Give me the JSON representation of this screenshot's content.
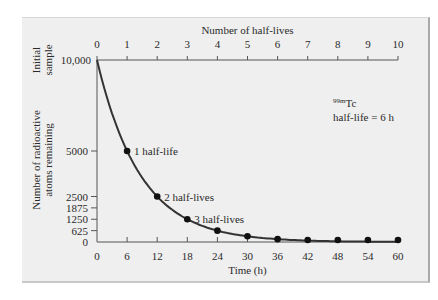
{
  "chart_data": {
    "type": "line",
    "title": "",
    "xlabel": "Time (h)",
    "x2label": "Number of half-lives",
    "ylabel": "Number of radioactive atoms remaining",
    "ylabel_top": "Initial sample",
    "x_ticks": [
      0,
      6,
      12,
      18,
      24,
      30,
      36,
      42,
      48,
      54,
      60
    ],
    "x2_ticks": [
      0,
      1,
      2,
      3,
      4,
      5,
      6,
      7,
      8,
      9,
      10
    ],
    "y_ticks": [
      "0",
      "625",
      "1250",
      "1875",
      "2500",
      "5000",
      "10,000"
    ],
    "y_tick_values": [
      0,
      625,
      1250,
      1875,
      2500,
      5000,
      10000
    ],
    "xlim": [
      0,
      60
    ],
    "ylim": [
      0,
      10000
    ],
    "series": [
      {
        "name": "99mTc decay",
        "x": [
          0,
          6,
          12,
          18,
          24,
          30,
          36,
          42,
          48,
          54,
          60
        ],
        "values": [
          10000,
          5000,
          2500,
          1250,
          625,
          312.5,
          156.25,
          78.1,
          39.1,
          19.5,
          9.8
        ],
        "markers_at": [
          6,
          12,
          18,
          24,
          30,
          36,
          42,
          48,
          54,
          60
        ]
      }
    ],
    "annotations": [
      {
        "text": "1 half-life",
        "x": 6,
        "y": 5000
      },
      {
        "text": "2 half-lives",
        "x": 12,
        "y": 2500
      },
      {
        "text": "3 half-lives",
        "x": 18,
        "y": 1250
      }
    ],
    "legend": {
      "isotope_sup": "99m",
      "isotope": "Tc",
      "half_life": "half-life = 6 h"
    },
    "grid": false
  }
}
